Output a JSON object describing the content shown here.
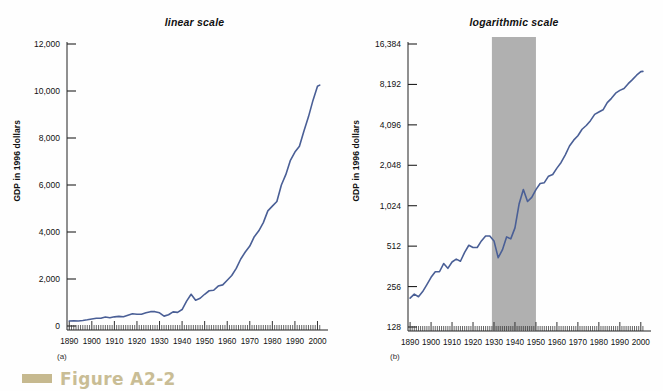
{
  "figure": {
    "caption_label": "Figure A2-2",
    "caption_icon": "square-bar-icon",
    "accent_color": "#c9bd95",
    "line_color": "#4a5f96",
    "shade_color": "#b0b0b0",
    "background_color": "#fefefe"
  },
  "panels": [
    {
      "id": "a",
      "sub_label": "(a)",
      "title": "linear scale",
      "ylabel": "GDP in 1996 dollars"
    },
    {
      "id": "b",
      "sub_label": "(b)",
      "title": "logarithmic scale",
      "ylabel": "GDP in 1996 dollars"
    }
  ],
  "chart_data": [
    {
      "type": "line",
      "panel": "a",
      "title": "linear scale",
      "xlabel": "",
      "ylabel": "GDP in 1996 dollars",
      "scale": "linear",
      "xlim": [
        1889,
        2002
      ],
      "ylim": [
        0,
        12000
      ],
      "grid": false,
      "legend": "none",
      "yticks": [
        0,
        2000,
        4000,
        6000,
        8000,
        10000,
        12000
      ],
      "ytick_labels": [
        "0",
        "2,000",
        "4,000",
        "6,000",
        "8,000",
        "10,000",
        "12,000"
      ],
      "xticks": [
        1890,
        1900,
        1910,
        1920,
        1930,
        1940,
        1950,
        1960,
        1970,
        1980,
        1990,
        2000
      ],
      "xtick_labels": [
        "1890",
        "1900",
        "1910",
        "1920",
        "1930",
        "1940",
        "1950",
        "1960",
        "1970",
        "1980",
        "1990",
        "2000"
      ],
      "series": [
        {
          "name": "Real GDP per capita",
          "color": "#4a5f96",
          "x": [
            1890,
            1892,
            1894,
            1896,
            1898,
            1900,
            1902,
            1904,
            1906,
            1908,
            1910,
            1912,
            1914,
            1916,
            1918,
            1920,
            1922,
            1924,
            1926,
            1928,
            1930,
            1932,
            1934,
            1936,
            1938,
            1940,
            1942,
            1944,
            1946,
            1948,
            1950,
            1952,
            1954,
            1956,
            1958,
            1960,
            1962,
            1964,
            1966,
            1968,
            1970,
            1972,
            1974,
            1976,
            1978,
            1980,
            1982,
            1984,
            1986,
            1988,
            1990,
            1992,
            1994,
            1996,
            1998,
            2000,
            2001
          ],
          "y": [
            210,
            225,
            215,
            235,
            265,
            300,
            330,
            330,
            380,
            350,
            390,
            410,
            395,
            460,
            520,
            500,
            500,
            560,
            610,
            610,
            560,
            420,
            480,
            600,
            580,
            700,
            1060,
            1350,
            1100,
            1180,
            1350,
            1500,
            1520,
            1700,
            1750,
            1950,
            2150,
            2450,
            2850,
            3150,
            3400,
            3800,
            4050,
            4400,
            4900,
            5100,
            5300,
            6000,
            6450,
            7050,
            7400,
            7650,
            8300,
            8900,
            9600,
            10200,
            10250
          ]
        }
      ]
    },
    {
      "type": "line",
      "panel": "b",
      "title": "logarithmic scale",
      "xlabel": "",
      "ylabel": "GDP in 1996 dollars",
      "scale": "log2",
      "xlim": [
        1889,
        2002
      ],
      "ylim": [
        128,
        16384
      ],
      "grid": false,
      "legend": "none",
      "yticks": [
        128,
        256,
        512,
        1024,
        2048,
        4096,
        8192,
        16384
      ],
      "ytick_labels": [
        "128",
        "256",
        "512",
        "1,024",
        "2,048",
        "4,096",
        "8,192",
        "16,384"
      ],
      "xticks": [
        1890,
        1900,
        1910,
        1920,
        1930,
        1940,
        1950,
        1960,
        1970,
        1980,
        1990,
        2000
      ],
      "xtick_labels": [
        "1890",
        "1900",
        "1910",
        "1920",
        "1930",
        "1940",
        "1950",
        "1960",
        "1970",
        "1980",
        "1990",
        "2000"
      ],
      "shaded_region": {
        "name": "depression-and-war-years",
        "x_start": 1929,
        "x_end": 1950,
        "color": "#b0b0b0"
      },
      "series": [
        {
          "name": "Real GDP per capita",
          "color": "#4a5f96",
          "x": [
            1890,
            1892,
            1894,
            1896,
            1898,
            1900,
            1902,
            1904,
            1906,
            1908,
            1910,
            1912,
            1914,
            1916,
            1918,
            1920,
            1922,
            1924,
            1926,
            1928,
            1930,
            1932,
            1934,
            1936,
            1938,
            1940,
            1942,
            1944,
            1946,
            1948,
            1950,
            1952,
            1954,
            1956,
            1958,
            1960,
            1962,
            1964,
            1966,
            1968,
            1970,
            1972,
            1974,
            1976,
            1978,
            1980,
            1982,
            1984,
            1986,
            1988,
            1990,
            1992,
            1994,
            1996,
            1998,
            2000,
            2001
          ],
          "y": [
            210,
            225,
            215,
            235,
            265,
            300,
            330,
            330,
            380,
            350,
            390,
            410,
            395,
            460,
            520,
            500,
            500,
            560,
            610,
            610,
            560,
            420,
            480,
            600,
            580,
            700,
            1060,
            1350,
            1100,
            1180,
            1350,
            1500,
            1520,
            1700,
            1750,
            1950,
            2150,
            2450,
            2850,
            3150,
            3400,
            3800,
            4050,
            4400,
            4900,
            5100,
            5300,
            6000,
            6450,
            7050,
            7400,
            7650,
            8300,
            8900,
            9600,
            10200,
            10250
          ]
        }
      ]
    }
  ]
}
